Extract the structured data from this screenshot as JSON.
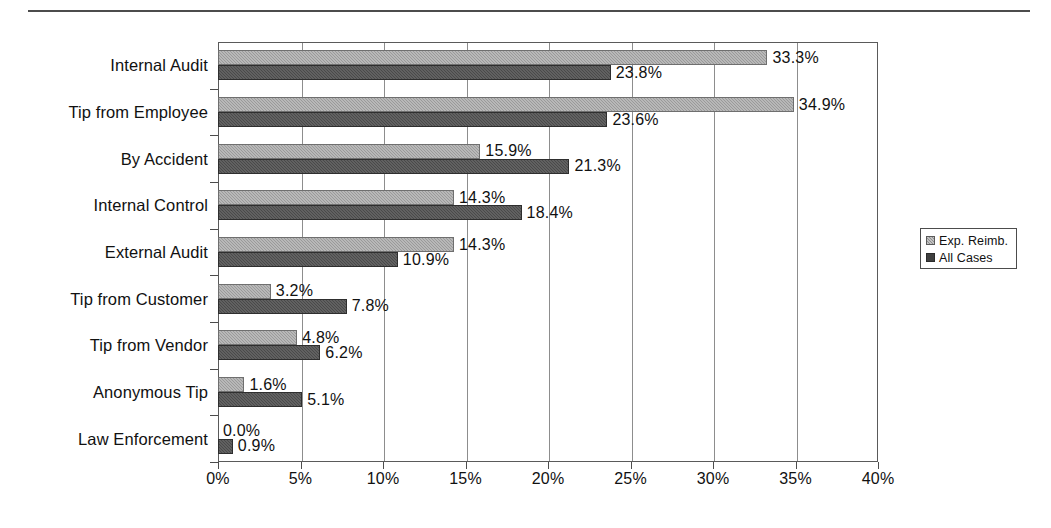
{
  "chart_data": {
    "type": "bar",
    "orientation": "horizontal",
    "title": "",
    "xlabel": "",
    "ylabel": "",
    "xlim": [
      0,
      40
    ],
    "xticks": [
      0,
      5,
      10,
      15,
      20,
      25,
      30,
      35,
      40
    ],
    "xtick_labels": [
      "0%",
      "5%",
      "10%",
      "15%",
      "20%",
      "25%",
      "30%",
      "35%",
      "40%"
    ],
    "grid": true,
    "grid_axis": "x",
    "legend_position": "right",
    "categories": [
      "Internal Audit",
      "Tip from Employee",
      "By Accident",
      "Internal Control",
      "External Audit",
      "Tip from Customer",
      "Tip from Vendor",
      "Anonymous Tip",
      "Law Enforcement"
    ],
    "series": [
      {
        "name": "Exp. Reimb.",
        "color": "#9a9a9a",
        "values": [
          33.3,
          34.9,
          15.9,
          14.3,
          14.3,
          3.2,
          4.8,
          1.6,
          0.0
        ],
        "labels": [
          "33.3%",
          "34.9%",
          "15.9%",
          "14.3%",
          "14.3%",
          "3.2%",
          "4.8%",
          "1.6%",
          "0.0%"
        ]
      },
      {
        "name": "All Cases",
        "color": "#4a4a4a",
        "values": [
          23.8,
          23.6,
          21.3,
          18.4,
          10.9,
          7.8,
          6.2,
          5.1,
          0.9
        ],
        "labels": [
          "23.8%",
          "23.6%",
          "21.3%",
          "18.4%",
          "10.9%",
          "7.8%",
          "6.2%",
          "5.1%",
          "0.9%"
        ]
      }
    ]
  },
  "legend": {
    "items": [
      {
        "label": "Exp. Reimb.",
        "swatch": "light"
      },
      {
        "label": "All Cases",
        "swatch": "dark"
      }
    ]
  }
}
